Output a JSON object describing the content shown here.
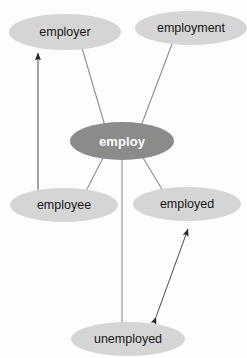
{
  "diagram": {
    "type": "semantic-network",
    "background_color": "#fdfdfd",
    "hub_color": "#8b8b8b",
    "satellite_color": "#d5d5d5",
    "line_color": "#8c8c8c",
    "arrow_color": "#2a2a2a",
    "nodes": [
      {
        "id": "employer",
        "label": "employer",
        "role": "satellite",
        "cx": 65,
        "cy": 32,
        "rx": 56,
        "ry": 18
      },
      {
        "id": "employment",
        "label": "employment",
        "role": "satellite",
        "cx": 191,
        "cy": 28,
        "rx": 56,
        "ry": 17
      },
      {
        "id": "employ",
        "label": "employ",
        "role": "hub",
        "cx": 122,
        "cy": 141,
        "rx": 52,
        "ry": 19
      },
      {
        "id": "employee",
        "label": "employee",
        "role": "satellite",
        "cx": 64,
        "cy": 205,
        "rx": 54,
        "ry": 17
      },
      {
        "id": "employed",
        "label": "employed",
        "role": "satellite",
        "cx": 187,
        "cy": 204,
        "rx": 54,
        "ry": 17
      },
      {
        "id": "unemployed",
        "label": "unemployed",
        "role": "satellite",
        "cx": 128,
        "cy": 339,
        "rx": 57,
        "ry": 17
      }
    ],
    "edges": [
      {
        "from": "employ",
        "to": "employer",
        "style": "plain-line",
        "arrows": "none"
      },
      {
        "from": "employ",
        "to": "employment",
        "style": "plain-line",
        "arrows": "none"
      },
      {
        "from": "employ",
        "to": "employee",
        "style": "plain-line",
        "arrows": "none"
      },
      {
        "from": "employ",
        "to": "employed",
        "style": "plain-line",
        "arrows": "none"
      },
      {
        "from": "employ",
        "to": "unemployed",
        "style": "plain-line",
        "arrows": "none"
      },
      {
        "from": "employer",
        "to": "employee",
        "style": "arrow-line",
        "arrows": "both"
      },
      {
        "from": "employed",
        "to": "unemployed",
        "style": "arrow-line",
        "arrows": "both"
      }
    ]
  }
}
